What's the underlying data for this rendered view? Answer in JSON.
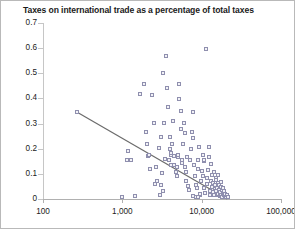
{
  "chart_data": {
    "type": "scatter",
    "title": "Taxes on international trade as a percentage of total taxes",
    "xlabel": "",
    "ylabel": "",
    "xscale": "log",
    "yscale": "linear",
    "xlim": [
      100,
      100000
    ],
    "ylim": [
      0,
      0.7
    ],
    "grid": false,
    "legend": null,
    "x_ticks": [
      100,
      1000,
      10000,
      100000
    ],
    "x_tick_labels": [
      "100",
      "1,000",
      "10,000",
      "100,000"
    ],
    "y_ticks": [
      0,
      0.1,
      0.2,
      0.3,
      0.4,
      0.5,
      0.6,
      0.7
    ],
    "y_tick_labels": [
      "0",
      "0.1",
      "0.2",
      "0.3",
      "0.4",
      "0.5",
      "0.6",
      "0.7"
    ],
    "marker_style": "open-square",
    "marker_color": "#8f8fae",
    "trendline": {
      "type": "linear-on-log-x",
      "color": "#6b6b6b",
      "x_start": 270,
      "y_start": 0.345,
      "x_end": 21000,
      "y_end": 0.0
    },
    "points": [
      [
        270,
        0.345
      ],
      [
        1180,
        0.19
      ],
      [
        1150,
        0.155
      ],
      [
        1320,
        0.152
      ],
      [
        1700,
        0.415
      ],
      [
        1900,
        0.455
      ],
      [
        2000,
        0.265
      ],
      [
        2100,
        0.215
      ],
      [
        2250,
        0.118
      ],
      [
        2400,
        0.41
      ],
      [
        2550,
        0.3
      ],
      [
        2700,
        0.125
      ],
      [
        2800,
        0.071
      ],
      [
        2950,
        0.2
      ],
      [
        3100,
        0.055
      ],
      [
        3150,
        0.245
      ],
      [
        3300,
        0.5
      ],
      [
        3400,
        0.3
      ],
      [
        3500,
        0.158
      ],
      [
        3600,
        0.565
      ],
      [
        3700,
        0.44
      ],
      [
        3800,
        0.362
      ],
      [
        3900,
        0.155
      ],
      [
        4000,
        0.245
      ],
      [
        4100,
        0.195
      ],
      [
        4200,
        0.135
      ],
      [
        4300,
        0.215
      ],
      [
        4400,
        0.31
      ],
      [
        4500,
        0.135
      ],
      [
        4600,
        0.168
      ],
      [
        4800,
        0.105
      ],
      [
        4900,
        0.125
      ],
      [
        5000,
        0.088
      ],
      [
        5200,
        0.455
      ],
      [
        5300,
        0.395
      ],
      [
        5500,
        0.35
      ],
      [
        5600,
        0.275
      ],
      [
        5700,
        0.14
      ],
      [
        5800,
        0.155
      ],
      [
        5900,
        0.215
      ],
      [
        6000,
        0.3
      ],
      [
        6200,
        0.26
      ],
      [
        6400,
        0.105
      ],
      [
        6500,
        0.068
      ],
      [
        6600,
        0.165
      ],
      [
        6800,
        0.048
      ],
      [
        7000,
        0.035
      ],
      [
        7200,
        0.155
      ],
      [
        7400,
        0.195
      ],
      [
        7600,
        0.265
      ],
      [
        7800,
        0.345
      ],
      [
        8000,
        0.24
      ],
      [
        8200,
        0.135
      ],
      [
        8400,
        0.088
      ],
      [
        8600,
        0.055
      ],
      [
        8800,
        0.042
      ],
      [
        9000,
        0.155
      ],
      [
        9200,
        0.118
      ],
      [
        9400,
        0.205
      ],
      [
        9600,
        0.012
      ],
      [
        9800,
        0.018
      ],
      [
        10000,
        0.07
      ],
      [
        10200,
        0.108
      ],
      [
        10500,
        0.09
      ],
      [
        10800,
        0.148
      ],
      [
        11000,
        0.04
      ],
      [
        11200,
        0.022
      ],
      [
        11500,
        0.595
      ],
      [
        11800,
        0.082
      ],
      [
        12000,
        0.058
      ],
      [
        12200,
        0.115
      ],
      [
        12500,
        0.165
      ],
      [
        12800,
        0.03
      ],
      [
        13000,
        0.012
      ],
      [
        13200,
        0.068
      ],
      [
        13500,
        0.095
      ],
      [
        13800,
        0.045
      ],
      [
        14000,
        0.025
      ],
      [
        14200,
        0.06
      ],
      [
        14500,
        0.015
      ],
      [
        14800,
        0.038
      ],
      [
        15000,
        0.055
      ],
      [
        15200,
        0.08
      ],
      [
        15500,
        0.028
      ],
      [
        15800,
        0.012
      ],
      [
        16000,
        0.042
      ],
      [
        16200,
        0.062
      ],
      [
        16500,
        0.018
      ],
      [
        16800,
        0.035
      ],
      [
        17000,
        0.052
      ],
      [
        17200,
        0.008
      ],
      [
        17500,
        0.025
      ],
      [
        17800,
        0.045
      ],
      [
        18000,
        0.015
      ],
      [
        18200,
        0.032
      ],
      [
        18500,
        0.005
      ],
      [
        18800,
        0.022
      ],
      [
        19000,
        0.04
      ],
      [
        19200,
        0.012
      ],
      [
        19500,
        0.028
      ],
      [
        19800,
        0.008
      ],
      [
        20000,
        0.018
      ],
      [
        20500,
        0.005
      ],
      [
        21000,
        0.012
      ],
      [
        22000,
        0.004
      ],
      [
        1000,
        0.005
      ],
      [
        1450,
        0.008
      ],
      [
        7900,
        0.008
      ],
      [
        8500,
        0.006
      ],
      [
        9100,
        0.005
      ],
      [
        5100,
        0.165
      ],
      [
        5050,
        0.172
      ],
      [
        4150,
        0.175
      ],
      [
        4180,
        0.182
      ],
      [
        2150,
        0.168
      ],
      [
        2180,
        0.172
      ],
      [
        6300,
        0.125
      ],
      [
        3250,
        0.1
      ],
      [
        3350,
        0.028
      ],
      [
        11000,
        0.155
      ],
      [
        12600,
        0.205
      ],
      [
        10400,
        0.172
      ],
      [
        13400,
        0.138
      ],
      [
        14600,
        0.105
      ],
      [
        15300,
        0.072
      ],
      [
        16400,
        0.095
      ],
      [
        17600,
        0.065
      ],
      [
        2650,
        0.058
      ],
      [
        3050,
        0.012
      ]
    ]
  }
}
